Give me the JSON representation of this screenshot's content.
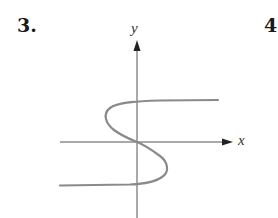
{
  "problems": [
    {
      "number": "3."
    },
    {
      "number": "4"
    }
  ],
  "graph": {
    "x_axis_label": "x",
    "y_axis_label": "y",
    "axis_color": "#555555",
    "curve_color": "#8a8a8a",
    "description": "S-shaped curve passing through the origin: horizontal asymptote-like branch at positive y to the right, bulges left in upper half, crosses origin, bulges right in lower half, horizontal branch at negative y to the left"
  }
}
